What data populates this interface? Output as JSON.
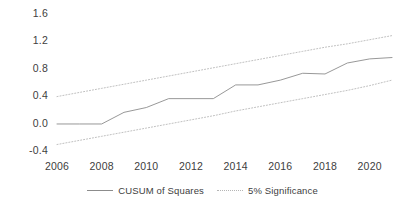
{
  "chart_data": {
    "type": "line",
    "title": "",
    "xlabel": "",
    "ylabel": "",
    "xlim": [
      2006,
      2021
    ],
    "ylim": [
      -0.4,
      1.6
    ],
    "yticks": [
      "1.6",
      "1.2",
      "0.8",
      "0.4",
      "0.0",
      "-0.4"
    ],
    "ytick_values": [
      1.6,
      1.2,
      0.8,
      0.4,
      0.0,
      -0.4
    ],
    "xticks": [
      "2006",
      "2008",
      "2010",
      "2012",
      "2014",
      "2016",
      "2018",
      "2020"
    ],
    "xtick_values": [
      2006,
      2008,
      2010,
      2012,
      2014,
      2016,
      2018,
      2020
    ],
    "grid": false,
    "legend_position": "bottom-center",
    "x": [
      2006,
      2007,
      2008,
      2009,
      2010,
      2011,
      2012,
      2013,
      2014,
      2015,
      2016,
      2017,
      2018,
      2019,
      2020,
      2021
    ],
    "series": [
      {
        "name": "CUSUM of Squares",
        "style": "solid",
        "color": "#8c8c8c",
        "values": [
          -0.02,
          -0.02,
          -0.02,
          0.15,
          0.22,
          0.35,
          0.35,
          0.35,
          0.55,
          0.55,
          0.62,
          0.72,
          0.71,
          0.87,
          0.93,
          0.95
        ]
      },
      {
        "name": "5% Significance",
        "style": "dotted",
        "color": "#b5b5b5",
        "bound": "upper",
        "values": [
          0.38,
          0.44,
          0.5,
          0.56,
          0.62,
          0.68,
          0.74,
          0.8,
          0.86,
          0.92,
          0.98,
          1.04,
          1.1,
          1.15,
          1.21,
          1.27
        ]
      },
      {
        "name": "5% Significance",
        "style": "dotted",
        "color": "#b5b5b5",
        "bound": "lower",
        "values": [
          -0.32,
          -0.26,
          -0.2,
          -0.14,
          -0.08,
          -0.02,
          0.04,
          0.1,
          0.17,
          0.23,
          0.29,
          0.35,
          0.41,
          0.47,
          0.54,
          0.62
        ]
      }
    ],
    "legend": [
      {
        "label": "CUSUM of Squares",
        "style": "solid",
        "color": "#8c8c8c"
      },
      {
        "label": "5% Significance",
        "style": "dotted",
        "color": "#b5b5b5"
      }
    ]
  },
  "axes": {
    "y_labels": [
      {
        "text": "1.6",
        "value": 1.6
      },
      {
        "text": "1.2",
        "value": 1.2
      },
      {
        "text": "0.8",
        "value": 0.8
      },
      {
        "text": "0.4",
        "value": 0.4
      },
      {
        "text": "0.0",
        "value": 0.0
      },
      {
        "text": "-0.4",
        "value": -0.4
      }
    ],
    "x_labels": [
      {
        "text": "2006",
        "value": 2006
      },
      {
        "text": "2008",
        "value": 2008
      },
      {
        "text": "2010",
        "value": 2010
      },
      {
        "text": "2012",
        "value": 2012
      },
      {
        "text": "2014",
        "value": 2014
      },
      {
        "text": "2016",
        "value": 2016
      },
      {
        "text": "2018",
        "value": 2018
      },
      {
        "text": "2020",
        "value": 2020
      }
    ]
  }
}
